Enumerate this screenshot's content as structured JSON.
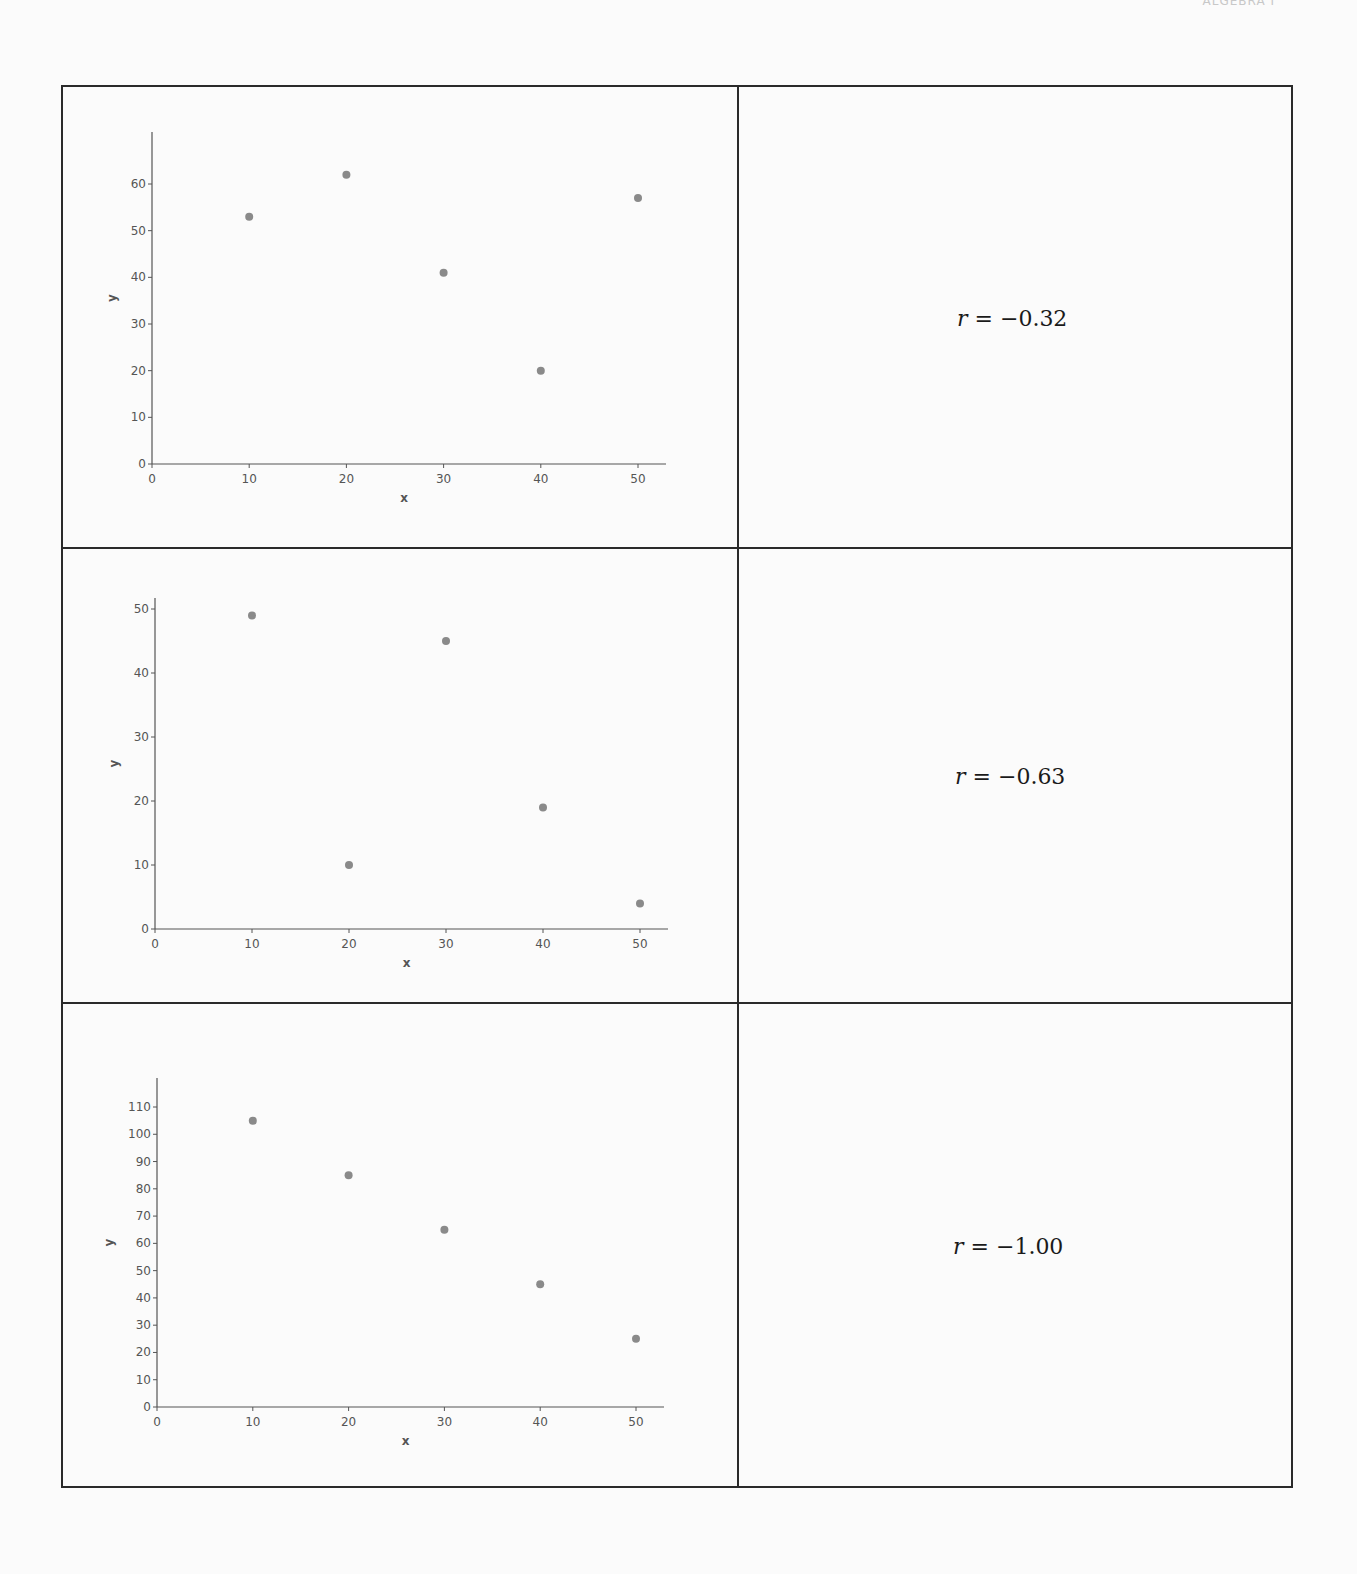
{
  "header": {
    "text": "ALGEBRA I"
  },
  "chart_data": [
    {
      "type": "scatter",
      "title": "",
      "xlabel": "x",
      "ylabel": "y",
      "xlim": [
        0,
        53
      ],
      "ylim": [
        0,
        70
      ],
      "xticks": [
        0,
        10,
        20,
        30,
        40,
        50
      ],
      "yticks": [
        0,
        10,
        20,
        30,
        40,
        50,
        60
      ],
      "x": [
        10,
        20,
        30,
        40,
        50
      ],
      "y": [
        53,
        62,
        41,
        20,
        57
      ],
      "grid": false,
      "correlation_label": {
        "var": "r",
        "text": " = −0.32"
      }
    },
    {
      "type": "scatter",
      "title": "",
      "xlabel": "x",
      "ylabel": "y",
      "xlim": [
        0,
        53
      ],
      "ylim": [
        0,
        51
      ],
      "xticks": [
        0,
        10,
        20,
        30,
        40,
        50
      ],
      "yticks": [
        0,
        10,
        20,
        30,
        40,
        50
      ],
      "x": [
        10,
        20,
        30,
        40,
        50
      ],
      "y": [
        49,
        10,
        45,
        19,
        4
      ],
      "grid": false,
      "correlation_label": {
        "var": "r",
        "text": " = −0.63"
      }
    },
    {
      "type": "scatter",
      "title": "",
      "xlabel": "x",
      "ylabel": "y",
      "xlim": [
        0,
        53
      ],
      "ylim": [
        0,
        121
      ],
      "xticks": [
        0,
        10,
        20,
        30,
        40,
        50
      ],
      "yticks": [
        0,
        10,
        20,
        30,
        40,
        50,
        60,
        70,
        80,
        90,
        100,
        110
      ],
      "x": [
        10,
        20,
        30,
        40,
        50
      ],
      "y": [
        105,
        85,
        65,
        45,
        25
      ],
      "grid": false,
      "correlation_label": {
        "var": "r",
        "text": " = −1.00"
      }
    }
  ],
  "colors": {
    "point": "#8a8a8a",
    "axis": "#555555",
    "border": "#2a2a2a"
  }
}
